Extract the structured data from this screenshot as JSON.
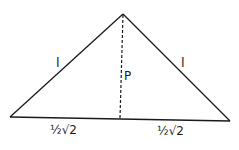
{
  "diagram": {
    "type": "isosceles-triangle-with-altitude",
    "colors": {
      "line": "#1a1a1a",
      "background": "#ffffff"
    },
    "vertices": {
      "apex": [
        123,
        14
      ],
      "left": [
        10,
        117
      ],
      "right": [
        230,
        121
      ],
      "altitude_foot": [
        120,
        118
      ]
    },
    "labels": {
      "left_side": "l",
      "right_side": "l",
      "altitude": "P",
      "left_half_base": "½√2",
      "right_half_base": "½√2"
    }
  }
}
